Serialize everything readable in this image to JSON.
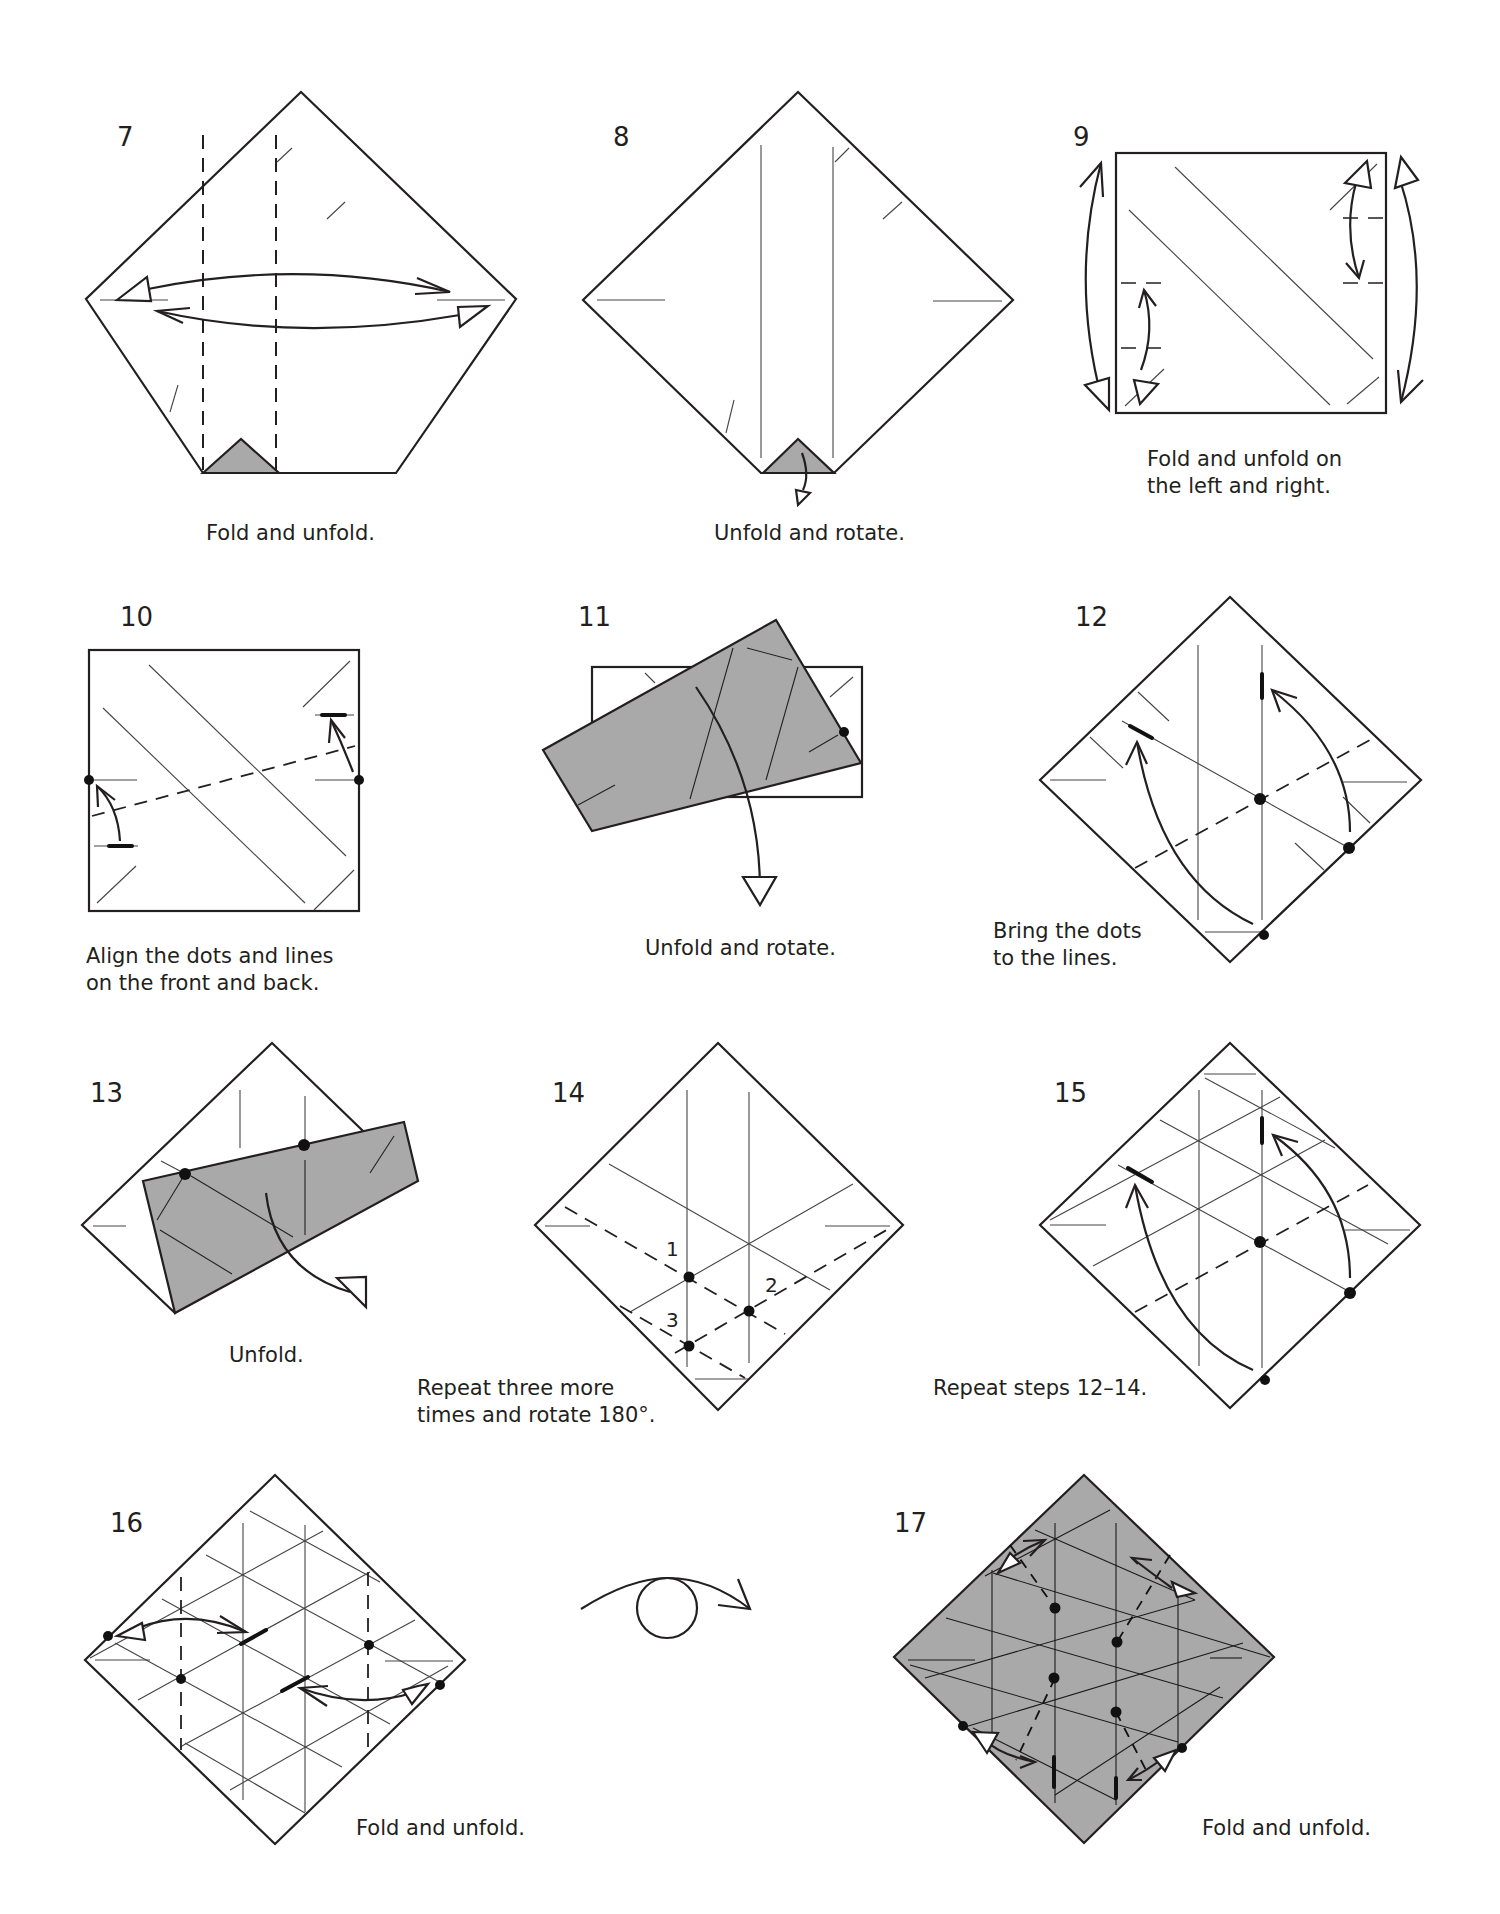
{
  "page": {
    "background": "#ffffff",
    "paper_gray": "#a9a9a9",
    "ink": "#231f20"
  },
  "steps": [
    {
      "number": "7",
      "caption_lines": [
        "Fold and unfold."
      ]
    },
    {
      "number": "8",
      "caption_lines": [
        "Unfold and rotate."
      ]
    },
    {
      "number": "9",
      "caption_lines": [
        "Fold and unfold on",
        "the left and right."
      ]
    },
    {
      "number": "10",
      "caption_lines": [
        "Align the dots and lines",
        "on the front and back."
      ]
    },
    {
      "number": "11",
      "caption_lines": [
        "Unfold and rotate."
      ]
    },
    {
      "number": "12",
      "caption_lines": [
        "Bring the dots",
        "to the lines."
      ]
    },
    {
      "number": "13",
      "caption_lines": [
        "Unfold."
      ]
    },
    {
      "number": "14",
      "caption_lines": [
        "Repeat three more",
        "times and rotate 180°."
      ],
      "point_labels": [
        "1",
        "2",
        "3"
      ]
    },
    {
      "number": "15",
      "caption_lines": [
        "Repeat steps 12–14."
      ]
    },
    {
      "number": "16",
      "caption_lines": [
        "Fold and unfold."
      ]
    },
    {
      "number": "turn-over",
      "symbol": "turn-over-icon"
    },
    {
      "number": "17",
      "caption_lines": [
        "Fold and unfold."
      ]
    }
  ]
}
